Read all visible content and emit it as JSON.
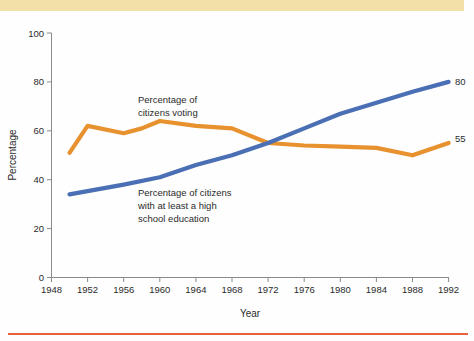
{
  "chart_data": {
    "type": "line",
    "title": "",
    "xlabel": "Year",
    "ylabel": "Percentage",
    "xlim": [
      1948,
      1992
    ],
    "ylim": [
      0,
      100
    ],
    "grid": false,
    "legend_position": "inline-annotations",
    "x_ticks": [
      "1948",
      "1952",
      "1956",
      "1960",
      "1964",
      "1968",
      "1972",
      "1976",
      "1980",
      "1984",
      "1988",
      "1992"
    ],
    "y_ticks": [
      "0",
      "20",
      "40",
      "60",
      "80",
      "100"
    ],
    "series": [
      {
        "name": "Percentage of citizens voting",
        "color": "#e8912f",
        "annotation": "Percentage of\ncitizens voting",
        "end_label": "55",
        "x": [
          1950,
          1952,
          1956,
          1958,
          1960,
          1964,
          1968,
          1972,
          1976,
          1980,
          1984,
          1988,
          1992
        ],
        "values": [
          51,
          62,
          59,
          61,
          64,
          62,
          61,
          55,
          54,
          53.5,
          53,
          50,
          55
        ]
      },
      {
        "name": "Percentage of citizens with at least a high school education",
        "color": "#4a6fb5",
        "annotation": "Percentage of citizens\nwith at least a high\nschool education",
        "end_label": "80",
        "x": [
          1950,
          1956,
          1960,
          1964,
          1968,
          1972,
          1976,
          1980,
          1984,
          1988,
          1992
        ],
        "values": [
          34,
          38,
          41,
          46,
          50,
          55,
          61,
          67,
          71.5,
          76,
          80
        ]
      }
    ]
  },
  "annotations": {
    "voting_line1": "Percentage of",
    "voting_line2": "citizens voting",
    "education_line1": "Percentage of citizens",
    "education_line2": "with at least a high",
    "education_line3": "school education"
  },
  "axes": {
    "x_title": "Year",
    "y_title": "Percentage"
  },
  "end_labels": {
    "blue": "80",
    "orange": "55"
  },
  "colors": {
    "voting": "#e8912f",
    "education": "#4a6fb5",
    "band": "#f2e0a8",
    "rule": "#e8603c",
    "axis": "#8a8a8a",
    "text": "#2b2b2b"
  }
}
